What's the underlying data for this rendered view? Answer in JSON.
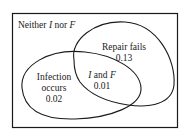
{
  "diagram": {
    "type": "venn",
    "regions": {
      "neither": {
        "prefix": "Neither ",
        "set_a": "I",
        "mid": " nor ",
        "set_b": "F"
      },
      "repair_fails": {
        "label": "Repair fails",
        "value": "0.13"
      },
      "infection_occurs": {
        "label_line1": "Infection",
        "label_line2": "occurs",
        "value": "0.02"
      },
      "intersection": {
        "set_a": "I",
        "mid": " and ",
        "set_b": "F",
        "value": "0.01"
      }
    },
    "colors": {
      "stroke": "#1a1a1a",
      "background": "#ffffff"
    }
  }
}
